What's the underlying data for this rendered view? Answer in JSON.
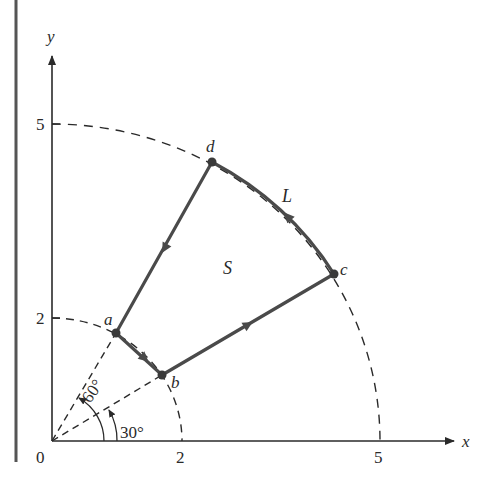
{
  "figure": {
    "axes": {
      "x_label": "x",
      "y_label": "y",
      "origin_label": "0",
      "x_ticks": [
        "2",
        "5"
      ],
      "y_ticks": [
        "2",
        "5"
      ]
    },
    "points": [
      {
        "id": "a",
        "label": "a"
      },
      {
        "id": "b",
        "label": "b"
      },
      {
        "id": "c",
        "label": "c"
      },
      {
        "id": "d",
        "label": "d"
      }
    ],
    "curve_label": "L",
    "region_label": "S",
    "angles": [
      {
        "label": "30°"
      },
      {
        "label": "60°"
      }
    ],
    "radii": [
      "2",
      "5"
    ],
    "colors": {
      "curve": "#4a4a4a",
      "axis": "#2a2a2a",
      "dashed": "#2a2a2a"
    }
  }
}
